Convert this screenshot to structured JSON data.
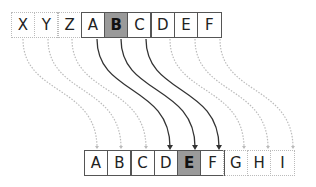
{
  "diagram": {
    "top_row": [
      {
        "label": "X",
        "style": "dotted"
      },
      {
        "label": "Y",
        "style": "dotted"
      },
      {
        "label": "Z",
        "style": "dotted"
      },
      {
        "label": "A",
        "style": "solid"
      },
      {
        "label": "B",
        "style": "highlight"
      },
      {
        "label": "C",
        "style": "solid"
      },
      {
        "label": "D",
        "style": "solid"
      },
      {
        "label": "E",
        "style": "solid"
      },
      {
        "label": "F",
        "style": "solid"
      }
    ],
    "bottom_row": [
      {
        "label": "A",
        "style": "solid"
      },
      {
        "label": "B",
        "style": "solid"
      },
      {
        "label": "C",
        "style": "solid"
      },
      {
        "label": "D",
        "style": "solid"
      },
      {
        "label": "E",
        "style": "highlight"
      },
      {
        "label": "F",
        "style": "solid"
      },
      {
        "label": "G",
        "style": "dotted"
      },
      {
        "label": "H",
        "style": "dotted"
      },
      {
        "label": "I",
        "style": "dotted"
      }
    ],
    "colors": {
      "highlight": "#9a9a9a",
      "solid_arrow": "#333333",
      "dotted_arrow": "#bbbbbb"
    }
  }
}
